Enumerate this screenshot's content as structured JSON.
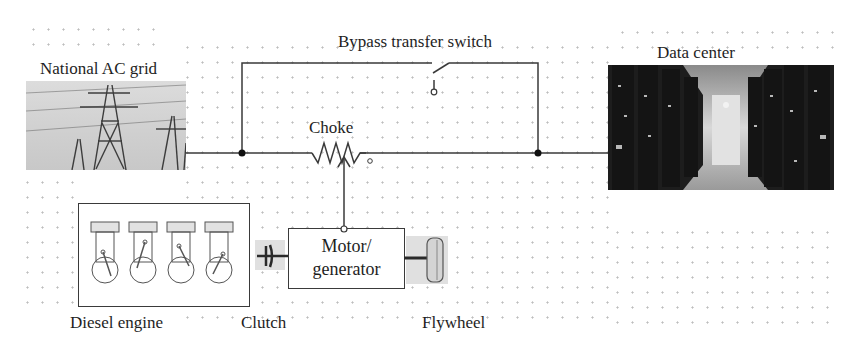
{
  "diagram": {
    "labels": {
      "grid": "National AC grid",
      "bypass": "Bypass transfer switch",
      "datacenter": "Data center",
      "choke": "Choke",
      "motor_line1": "Motor/",
      "motor_line2": "generator",
      "engine": "Diesel engine",
      "clutch": "Clutch",
      "flywheel": "Flywheel"
    },
    "components": [
      {
        "id": "grid",
        "name": "National AC grid",
        "icon": "transmission-tower-photo"
      },
      {
        "id": "bypass",
        "name": "Bypass transfer switch",
        "icon": "open-switch-symbol"
      },
      {
        "id": "choke",
        "name": "Choke",
        "icon": "variable-inductor-symbol"
      },
      {
        "id": "datacenter",
        "name": "Data center",
        "icon": "server-aisle-photo"
      },
      {
        "id": "motor",
        "name": "Motor/generator",
        "icon": "box"
      },
      {
        "id": "engine",
        "name": "Diesel engine",
        "icon": "four-cylinder-engine"
      },
      {
        "id": "clutch",
        "name": "Clutch",
        "icon": "clutch-symbol"
      },
      {
        "id": "flywheel",
        "name": "Flywheel",
        "icon": "flywheel-disk"
      }
    ],
    "connections": [
      {
        "from": "grid",
        "to": "choke"
      },
      {
        "from": "choke",
        "to": "datacenter"
      },
      {
        "from": "grid",
        "to": "bypass"
      },
      {
        "from": "bypass",
        "to": "datacenter"
      },
      {
        "from": "motor",
        "to": "choke"
      },
      {
        "from": "engine",
        "to": "clutch"
      },
      {
        "from": "clutch",
        "to": "motor"
      },
      {
        "from": "motor",
        "to": "flywheel"
      }
    ],
    "colors": {
      "wire": "#3a3a3a",
      "grid_dots": "#bdbdbd",
      "background": "#ffffff"
    }
  }
}
